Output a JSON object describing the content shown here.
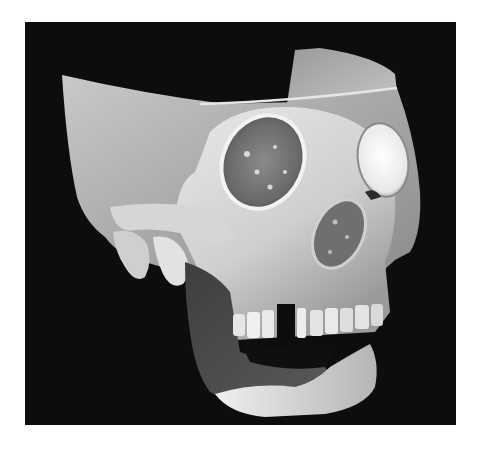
{
  "figure": {
    "style": "grayscale",
    "background_color": "#ffffff",
    "panel_color": "#0d0d0d",
    "bone_highlight_color": "#f2f2f2",
    "bone_mid_color": "#b8b8b8",
    "bone_shadow_color": "#6a6a6a",
    "mandible_soft_color": "#4a4a4a"
  }
}
